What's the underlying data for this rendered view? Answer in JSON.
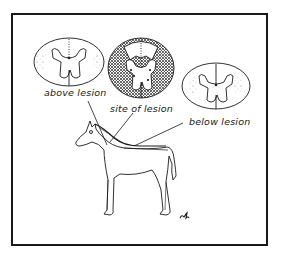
{
  "figure": {
    "labels": {
      "above": "above lesion",
      "site": "site of lesion",
      "below": "below lesion"
    },
    "signature": "ѡd",
    "sections": [
      {
        "name": "above lesion",
        "shading": "light"
      },
      {
        "name": "site of lesion",
        "shading": "heavy"
      },
      {
        "name": "below lesion",
        "shading": "light"
      }
    ],
    "colors": {
      "ink": "#1a1a1a",
      "background": "#ffffff"
    }
  }
}
